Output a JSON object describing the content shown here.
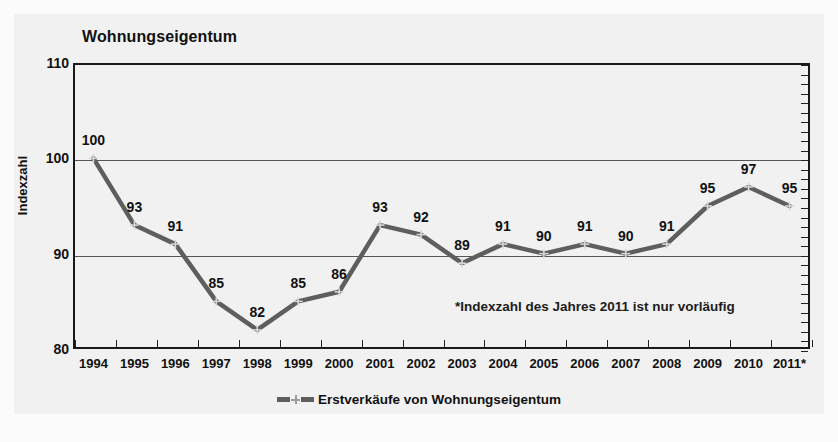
{
  "chart": {
    "title": "Wohnungseigentum",
    "y_axis_title": "Indexzahl",
    "footnote": "*Indexzahl des Jahres 2011 ist nur vorläufig",
    "legend_label": "Erstverkäufe von Wohnungseigentum",
    "series_color": "#5e5e5e",
    "gridline_color": "#555555",
    "axis_color": "#1a1a1a"
  },
  "chart_data": {
    "type": "line",
    "title": "Wohnungseigentum",
    "xlabel": "",
    "ylabel": "Indexzahl",
    "ylim": [
      80,
      110
    ],
    "yticks": [
      80,
      90,
      100,
      110
    ],
    "grid": true,
    "legend_position": "bottom-center",
    "categories": [
      "1994",
      "1995",
      "1996",
      "1997",
      "1998",
      "1999",
      "2000",
      "2001",
      "2002",
      "2003",
      "2004",
      "2005",
      "2006",
      "2007",
      "2008",
      "2009",
      "2010",
      "2011*"
    ],
    "series": [
      {
        "name": "Erstverkäufe von Wohnungseigentum",
        "values": [
          100,
          93,
          91,
          85,
          82,
          85,
          86,
          93,
          92,
          89,
          91,
          90,
          91,
          90,
          91,
          95,
          97,
          95
        ]
      }
    ],
    "annotations": [
      "*Indexzahl des Jahres 2011 ist nur vorläufig"
    ]
  }
}
